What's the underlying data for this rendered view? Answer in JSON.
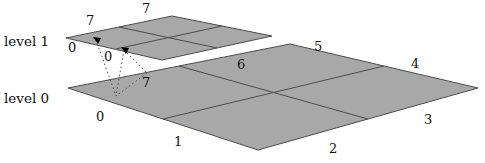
{
  "figure": {
    "colors": {
      "face_fill": "#a8a8a8",
      "face_stroke": "#4d4d4d",
      "dotted_line": "#555555",
      "text": "#111111",
      "background": "#ffffff",
      "marker": "#000000"
    }
  },
  "levels": [
    {
      "name": "level-1",
      "label": "level 1",
      "label_x": 4,
      "label_y": 35
    },
    {
      "name": "level-0",
      "label": "level 0",
      "label_x": 4,
      "label_y": 92
    }
  ],
  "level1": {
    "quad": {
      "left": [
        66,
        38
      ],
      "top": [
        172,
        16
      ],
      "right": [
        272,
        36
      ],
      "bottom": [
        162,
        60
      ]
    },
    "vertex_labels": [
      {
        "text": "7",
        "x": 86,
        "y": 14
      },
      {
        "text": "7",
        "x": 142,
        "y": 2
      },
      {
        "text": "0",
        "x": 68,
        "y": 41
      },
      {
        "text": "0",
        "x": 104,
        "y": 50
      }
    ],
    "markers": [
      [
        96,
        40
      ],
      [
        124,
        50
      ]
    ]
  },
  "level0": {
    "quad": {
      "left": [
        68,
        88
      ],
      "top": [
        290,
        44
      ],
      "right": [
        478,
        88
      ],
      "bottom": [
        258,
        150
      ]
    },
    "vertex_labels": [
      {
        "text": "5",
        "x": 314,
        "y": 40
      },
      {
        "text": "6",
        "x": 237,
        "y": 58
      },
      {
        "text": "4",
        "x": 411,
        "y": 57
      },
      {
        "text": "7",
        "x": 142,
        "y": 76
      },
      {
        "text": "3",
        "x": 424,
        "y": 113
      },
      {
        "text": "0",
        "x": 96,
        "y": 110
      },
      {
        "text": "1",
        "x": 174,
        "y": 135
      },
      {
        "text": "2",
        "x": 329,
        "y": 142
      }
    ]
  },
  "projection_lines": [
    {
      "from": [
        96,
        40
      ],
      "to": [
        116,
        96
      ]
    },
    {
      "from": [
        124,
        50
      ],
      "to": [
        116,
        96
      ]
    },
    {
      "from": [
        124,
        50
      ],
      "to": [
        147,
        73
      ]
    },
    {
      "from": [
        147,
        73
      ],
      "to": [
        116,
        96
      ]
    }
  ]
}
